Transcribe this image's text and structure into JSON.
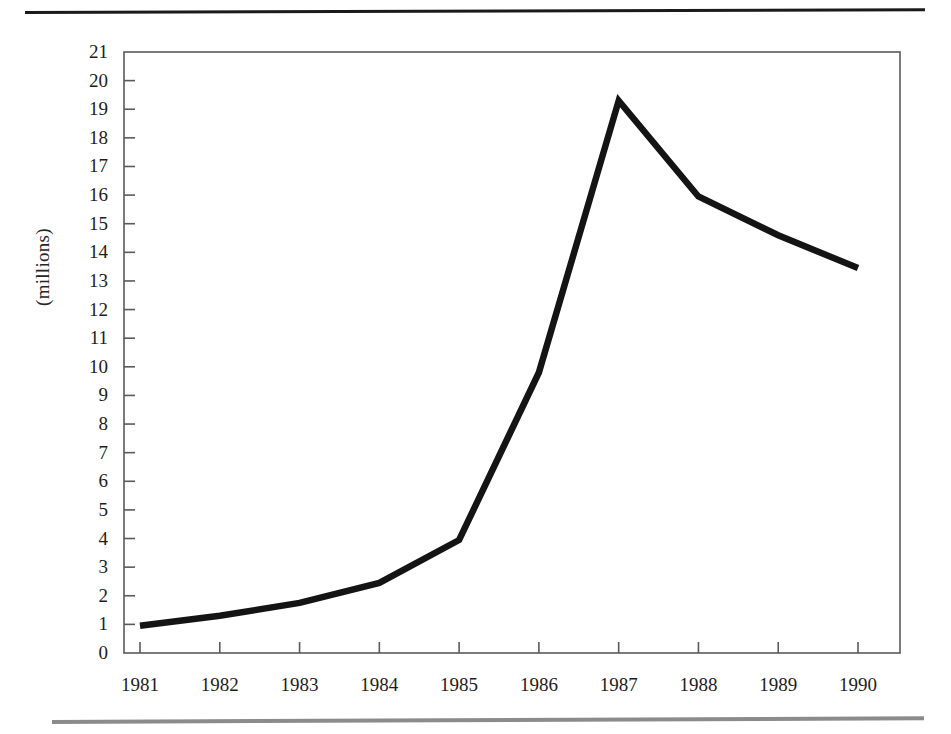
{
  "figure": {
    "background": "#ffffff",
    "line_color": "#141414",
    "axis_color": "#5a5a5a",
    "rule_top_color": "#1a1a1a",
    "rule_bottom_color": "#8b8b8b"
  },
  "chart_data": {
    "type": "line",
    "title": "",
    "subtitle": "",
    "xlabel": "",
    "ylabel": "(millions)",
    "categories": [
      "1981",
      "1982",
      "1983",
      "1984",
      "1985",
      "1986",
      "1987",
      "1988",
      "1989",
      "1990"
    ],
    "x": [
      1981,
      1982,
      1983,
      1984,
      1985,
      1986,
      1987,
      1988,
      1989,
      1990
    ],
    "values": [
      0.95,
      1.3,
      1.75,
      2.45,
      3.95,
      9.8,
      19.3,
      15.95,
      14.6,
      13.45
    ],
    "series": [
      {
        "name": "(millions)",
        "values": [
          0.95,
          1.3,
          1.75,
          2.45,
          3.95,
          9.8,
          19.3,
          15.95,
          14.6,
          13.45
        ]
      }
    ],
    "xlim": [
      1980.5,
      1990.5
    ],
    "ylim": [
      0,
      21
    ],
    "ytick_labels": [
      "21",
      "20",
      "19",
      "18",
      "17",
      "16",
      "15",
      "14",
      "13",
      "12",
      "11",
      "10",
      "9",
      "8",
      "7",
      "6",
      "5",
      "4",
      "3",
      "2",
      "1",
      "0"
    ],
    "ytick_values": [
      21,
      20,
      19,
      18,
      17,
      16,
      15,
      14,
      13,
      12,
      11,
      10,
      9,
      8,
      7,
      6,
      5,
      4,
      3,
      2,
      1,
      0
    ],
    "ytick_step": 1,
    "grid": false,
    "legend": null,
    "legend_position": "none",
    "annotations": []
  }
}
